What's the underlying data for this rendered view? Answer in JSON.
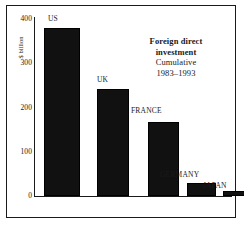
{
  "chart_data": {
    "type": "bar",
    "title": "",
    "categories": [
      "US",
      "UK",
      "FRANCE",
      "GERMANY",
      "JAPAN"
    ],
    "values": [
      375,
      240,
      165,
      28,
      12
    ],
    "xlabel": "",
    "ylabel": "$ billion",
    "ylim": [
      0,
      400
    ],
    "yticks": [
      0,
      100,
      200,
      300,
      400
    ],
    "ytick_labels": [
      "0",
      "100",
      "200",
      "300",
      "400"
    ],
    "grid": false,
    "legend": "none",
    "bar_color": "#111111",
    "axis_color": "#1a1a1a",
    "background": "#ffffff"
  },
  "annotation": {
    "line1": "Foreign direct",
    "line2": "investment",
    "line3": "Cumulative",
    "line4": "1983–1993"
  },
  "axis": {
    "y_title": "$ billion",
    "ticks": [
      {
        "label": "400"
      },
      {
        "label": "300"
      },
      {
        "label": "200"
      },
      {
        "label": "100"
      },
      {
        "label": "0"
      }
    ]
  },
  "bars": [
    {
      "label": "US",
      "value": 375
    },
    {
      "label": "UK",
      "value": 240
    },
    {
      "label": "FRANCE",
      "value": 165
    },
    {
      "label": "GERMANY",
      "value": 28
    },
    {
      "label": "JAPAN",
      "value": 12
    }
  ]
}
